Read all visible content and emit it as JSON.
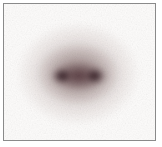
{
  "figure": {
    "kind": "blurred-double-spot-image",
    "canvas_background_color": "#ffffff",
    "frame_border_color": "#8a8a8a",
    "inner_background_color": "#fdfcfb",
    "core_color": "#2a141b",
    "bridge_color": "#52343a",
    "halo_color": "#a8928f",
    "gradient_layers": [
      {
        "x": 58,
        "y": 72,
        "rx": 13,
        "ry": 11,
        "color": "rgba(42,20,27,0.95)",
        "fade": "72%"
      },
      {
        "x": 91,
        "y": 72,
        "rx": 13,
        "ry": 11,
        "color": "rgba(42,20,27,0.95)",
        "fade": "72%"
      },
      {
        "x": 75,
        "y": 72,
        "rx": 36,
        "ry": 17,
        "color": "rgba(82,52,58,0.85)",
        "fade": "88%"
      },
      {
        "x": 74,
        "y": 70,
        "rx": 48,
        "ry": 36,
        "color": "rgba(130,108,108,0.75)",
        "fade": "90%"
      },
      {
        "x": 74,
        "y": 70,
        "rx": 68,
        "ry": 57,
        "color": "rgba(172,150,147,0.65)",
        "fade": "92%"
      }
    ],
    "noise": {
      "base_frequency": "0.8",
      "octaves": "2",
      "opacity": "0.16"
    }
  }
}
